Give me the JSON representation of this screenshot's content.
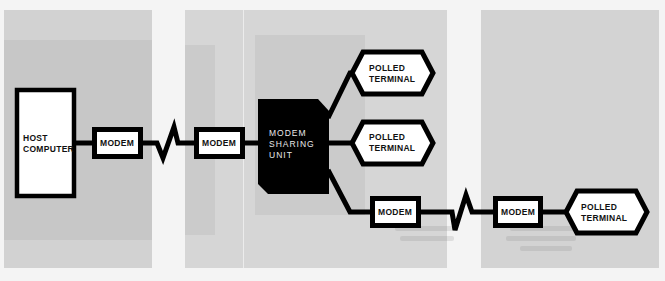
{
  "diagram": {
    "colors": {
      "line": "#000000",
      "box_fill": "#ffffff",
      "sharing_unit_fill": "#000000",
      "panel_gray": "#d3d3d3",
      "page_background": "#f4f4f4"
    },
    "nodes": {
      "host": {
        "line1": "HOST",
        "line2": "COMPUTER"
      },
      "modem_1": {
        "label": "MODEM"
      },
      "modem_2": {
        "label": "MODEM"
      },
      "sharing_unit": {
        "line1": "MODEM",
        "line2": "SHARING",
        "line3": "UNIT"
      },
      "terminal_1": {
        "line1": "POLLED",
        "line2": "TERMINAL"
      },
      "terminal_2": {
        "line1": "POLLED",
        "line2": "TERMINAL"
      },
      "modem_3": {
        "label": "MODEM"
      },
      "modem_4": {
        "label": "MODEM"
      },
      "terminal_3": {
        "line1": "POLLED",
        "line2": "TERMINAL"
      }
    },
    "edges": [
      {
        "from": "host",
        "to": "modem_1",
        "type": "wire"
      },
      {
        "from": "modem_1",
        "to": "modem_2",
        "type": "telephone-link"
      },
      {
        "from": "modem_2",
        "to": "sharing_unit",
        "type": "wire"
      },
      {
        "from": "sharing_unit",
        "to": "terminal_1",
        "type": "wire"
      },
      {
        "from": "sharing_unit",
        "to": "terminal_2",
        "type": "wire"
      },
      {
        "from": "sharing_unit",
        "to": "modem_3",
        "type": "wire"
      },
      {
        "from": "modem_3",
        "to": "modem_4",
        "type": "telephone-link"
      },
      {
        "from": "modem_4",
        "to": "terminal_3",
        "type": "wire"
      }
    ]
  }
}
